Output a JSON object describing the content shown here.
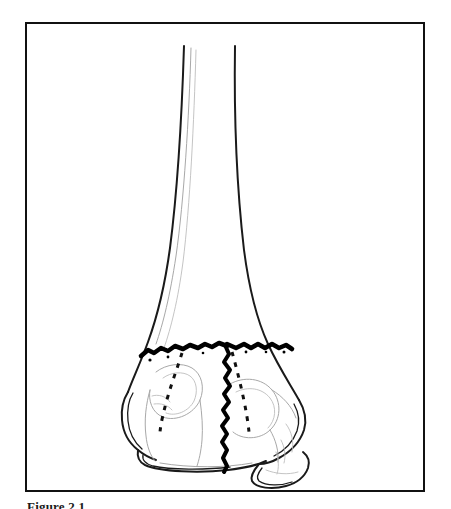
{
  "page": {
    "width": 451,
    "height": 509,
    "background_color": "#ffffff"
  },
  "figure": {
    "frame": {
      "border_color": "#111111",
      "border_width": 2.5,
      "x": 25,
      "y": 22,
      "width": 400,
      "height": 470
    },
    "caption": "Figure 2.1",
    "illustration": {
      "title": "Distal long bone with T-shaped intercondylar fracture",
      "style": "black-and-white line drawing",
      "outline_color": "#1a1a1a",
      "fracture_color": "#000000",
      "faint_line_color": "#9a9a9a",
      "elements": [
        "bone-shaft",
        "distal-flare",
        "medial-condyle",
        "lateral-condyle",
        "transverse-fracture-line",
        "vertical-fracture-line",
        "dashed-fracture-plane-left",
        "dashed-fracture-plane-right"
      ]
    }
  }
}
